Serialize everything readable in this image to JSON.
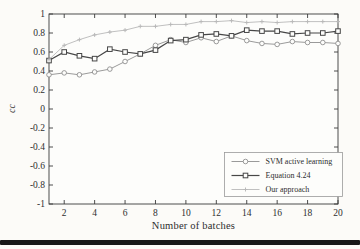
{
  "page": {
    "background": "#fcfbf8",
    "bottom_bar_color": "#181818"
  },
  "chart_data": {
    "type": "line",
    "title": "",
    "xlabel": "Number of batches",
    "ylabel": "cc",
    "xlim": [
      1,
      20
    ],
    "ylim": [
      -1,
      1
    ],
    "grid": false,
    "legend_position": "lower-right",
    "xticks": [
      2,
      4,
      6,
      8,
      10,
      12,
      14,
      16,
      18,
      20
    ],
    "ytick_labels": [
      "1",
      "0.8",
      "0.6",
      "0.4",
      "0.2",
      "0",
      "-0.2",
      "-0.4",
      "-0.6",
      "-0.8",
      "-1"
    ],
    "x": [
      1,
      2,
      3,
      4,
      5,
      6,
      7,
      8,
      9,
      10,
      11,
      12,
      13,
      14,
      15,
      16,
      17,
      18,
      19,
      20
    ],
    "series": [
      {
        "name": "SVM active learning",
        "marker": "circle",
        "color": "#8e8e8e",
        "line_width": 0.9,
        "values": [
          0.36,
          0.38,
          0.36,
          0.39,
          0.42,
          0.5,
          0.58,
          0.67,
          0.73,
          0.7,
          0.75,
          0.71,
          0.77,
          0.72,
          0.69,
          0.68,
          0.71,
          0.7,
          0.7,
          0.69
        ]
      },
      {
        "name": "Equation 4.24",
        "marker": "square",
        "color": "#474747",
        "line_width": 1.2,
        "values": [
          0.51,
          0.6,
          0.56,
          0.53,
          0.63,
          0.6,
          0.58,
          0.62,
          0.72,
          0.73,
          0.78,
          0.79,
          0.77,
          0.83,
          0.82,
          0.82,
          0.79,
          0.8,
          0.8,
          0.82
        ]
      },
      {
        "name": "Our approach",
        "marker": "plus",
        "color": "#b9b9b9",
        "line_width": 0.9,
        "values": [
          0.52,
          0.67,
          0.73,
          0.78,
          0.81,
          0.83,
          0.87,
          0.87,
          0.89,
          0.89,
          0.92,
          0.92,
          0.93,
          0.91,
          0.92,
          0.91,
          0.92,
          0.92,
          0.92,
          0.92
        ]
      }
    ],
    "axis_color": "#3a3a3a",
    "plot_fill": "#fdfdfb",
    "legend_border_color": "#9a9a9a"
  }
}
